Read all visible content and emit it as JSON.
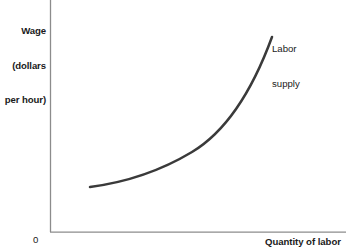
{
  "figure": {
    "background_color": "#ffffff",
    "width": 346,
    "height": 252
  },
  "axes": {
    "color": "#8c8c8c",
    "stroke_width": 1.2,
    "y_axis": {
      "x": 50,
      "y_top": 0,
      "y_bottom": 232
    },
    "x_axis": {
      "y": 232,
      "x_left": 50,
      "x_right": 346
    },
    "origin_label": "0",
    "y_axis_title_line1": "Wage",
    "y_axis_title_line2": "(dollars",
    "y_axis_title_line3": "per hour)",
    "x_axis_title": "Quantity of labor"
  },
  "curve": {
    "label_line1": "Labor",
    "label_line2": "supply",
    "color": "#3a3a3a",
    "stroke_width": 2.5,
    "path": "M 90 187 C 128 182, 162 170, 192 152 C 222 134, 250 97, 272 37"
  },
  "chart_data": {
    "type": "line",
    "title": "",
    "xlabel": "Quantity of labor",
    "ylabel": "Wage (dollars per hour)",
    "xlim": [
      0,
      100
    ],
    "ylim": [
      0,
      100
    ],
    "grid": false,
    "legend": "inline-annotation",
    "axis_ticks": {
      "x": [],
      "y": []
    },
    "origin_label": "0",
    "annotations": [
      {
        "text": "Labor supply",
        "x": 76,
        "y": 91
      }
    ],
    "series": [
      {
        "name": "Labor supply",
        "x": [
          13.5,
          24,
          34,
          48,
          58,
          67,
          74,
          75
        ],
        "y": [
          19.4,
          21.5,
          25.0,
          33.2,
          42.0,
          55.0,
          77.0,
          84.1
        ],
        "description": "Upward-sloping convex labor supply curve: wage rises with quantity of labor at an increasing rate"
      }
    ]
  }
}
